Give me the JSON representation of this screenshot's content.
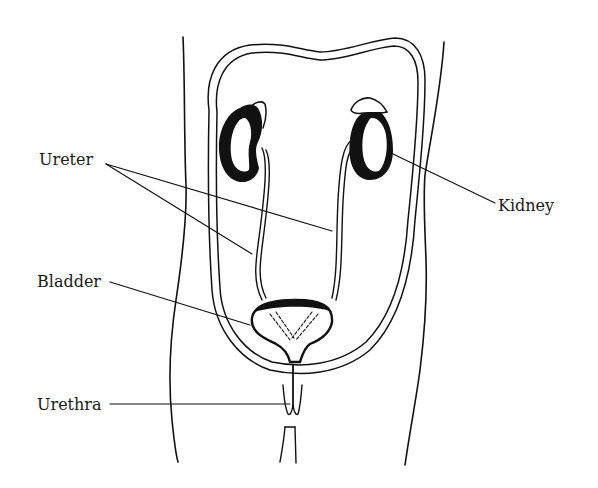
{
  "diagram": {
    "labels": {
      "ureter": "Ureter",
      "kidney": "Kidney",
      "bladder": "Bladder",
      "urethra": "Urethra"
    },
    "colors": {
      "ink": "#111111",
      "background": "#ffffff",
      "label_text": "#1a1a1a"
    },
    "parts": [
      "body-outline",
      "peritoneal-loop",
      "left-kidney",
      "right-kidney",
      "left-ureter",
      "right-ureter",
      "bladder",
      "urethra"
    ]
  }
}
